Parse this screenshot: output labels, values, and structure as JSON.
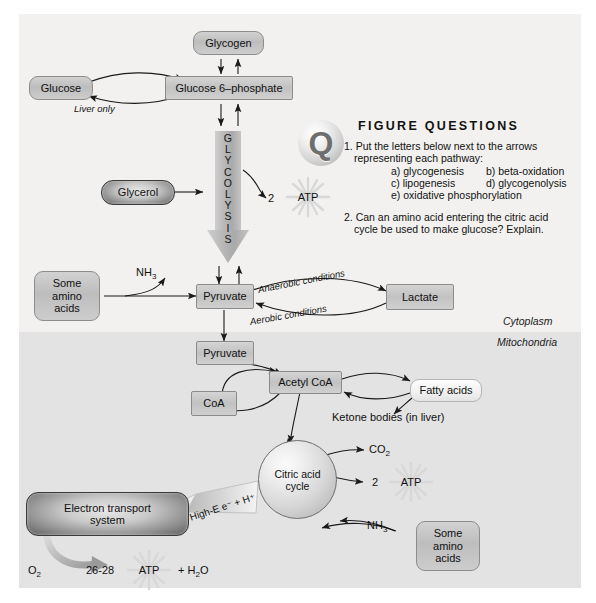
{
  "compartments": {
    "cytoplasm_label": "Cytoplasm",
    "mitochondria_label": "Mitochondria"
  },
  "nodes": {
    "glycogen": "Glycogen",
    "glucose": "Glucose",
    "glucose6p": "Glucose 6–phosphate",
    "glycerol": "Glycerol",
    "pyruvate_cyto": "Pyruvate",
    "pyruvate_mito": "Pyruvate",
    "lactate": "Lactate",
    "coa": "CoA",
    "acetyl_coa": "Acetyl CoA",
    "fatty_acids": "Fatty acids",
    "amino_acids_top": "Some\namino\nacids",
    "amino_acids_bottom": "Some\namino\nacids",
    "electron_transport": "Electron transport\nsystem",
    "citric_acid_cycle": "Citric acid\ncycle"
  },
  "pathway": {
    "glycolysis_letters": [
      "G",
      "L",
      "Y",
      "C",
      "O",
      "L",
      "Y",
      "S",
      "I",
      "S"
    ],
    "liver_only": "Liver only",
    "anaerobic": "Anaerobic conditions",
    "aerobic": "Aerobic conditions",
    "ketone_bodies": "Ketone bodies (in liver)",
    "high_energy": "High-E e⁻ + H⁺"
  },
  "molecules": {
    "nh3_top": "NH",
    "nh3_top_sub": "3",
    "nh3_bottom": "NH",
    "nh3_bottom_sub": "3",
    "co2": "CO",
    "co2_sub": "2",
    "o2": "O",
    "o2_sub": "2",
    "water": "+ H",
    "water_sub": "2",
    "water_tail": "O"
  },
  "atp": {
    "glycolysis_count": "2",
    "glycolysis_label": "ATP",
    "cycle_count": "2",
    "cycle_label": "ATP",
    "ets_count": "26-28",
    "ets_label": "ATP"
  },
  "questions": {
    "badge": "Q",
    "title": "FIGURE QUESTIONS",
    "q1": "1. Put the letters below next to the arrows",
    "q1_cont": "representing each pathway:",
    "options": [
      "a) glycogenesis",
      "b) beta-oxidation",
      "c) lipogenesis",
      "d) glycogenolysis",
      "e) oxidative phosphorylation"
    ],
    "q2": "2. Can an amino acid entering the citric acid",
    "q2_cont": "cycle be used to make glucose? Explain."
  },
  "colors": {
    "cytoplasm_bg": "#f2f1ef",
    "mitochondria_bg": "#e3e3e3",
    "node_fill": "#c8c8c8",
    "node_stroke": "#8b8b8b",
    "arrow": "#1a1a1a",
    "text": "#111111"
  }
}
